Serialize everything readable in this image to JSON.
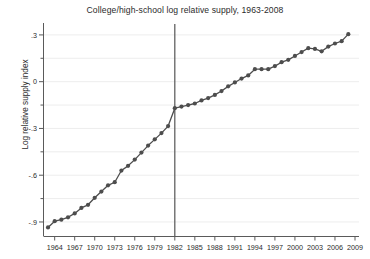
{
  "chart_data": {
    "type": "line",
    "title": "College/high-school log relative supply, 1963-2008",
    "xlabel": "",
    "ylabel": "Log relative supply index",
    "xlim": [
      1962.4,
      2009.6
    ],
    "ylim": [
      -0.99,
      0.37
    ],
    "xticks": [
      1964,
      1967,
      1970,
      1973,
      1976,
      1979,
      1982,
      1985,
      1988,
      1991,
      1994,
      1997,
      2000,
      2003,
      2006,
      2009
    ],
    "xtick_labels": [
      "1964",
      "1967",
      "1970",
      "1973",
      "1976",
      "1979",
      "1982",
      "1985",
      "1988",
      "1991",
      "1994",
      "1997",
      "2000",
      "2003",
      "2006",
      "2009"
    ],
    "yticks": [
      0.3,
      0.15,
      0,
      -0.15,
      -0.3,
      -0.45,
      -0.6,
      -0.75,
      -0.9
    ],
    "ytick_labels": [
      ".3",
      "",
      "0",
      "",
      "-.3",
      "",
      "-.6",
      "",
      "-.9"
    ],
    "ytick_major": [
      0.3,
      0,
      -0.3,
      -0.6,
      -0.9
    ],
    "grid": true,
    "legend": "none",
    "marker": "filled-circle",
    "line_color": "#4d4d4d",
    "marker_color": "#4d4d4d",
    "grid_color": "#ededed",
    "axis_color": "#5a5a5a",
    "vline": {
      "x": 1982,
      "color": "#555555",
      "label": ""
    },
    "x": [
      1963,
      1964,
      1965,
      1966,
      1967,
      1968,
      1969,
      1970,
      1971,
      1972,
      1973,
      1974,
      1975,
      1976,
      1977,
      1978,
      1979,
      1980,
      1981,
      1982,
      1983,
      1984,
      1985,
      1986,
      1987,
      1988,
      1989,
      1990,
      1991,
      1992,
      1993,
      1994,
      1995,
      1996,
      1997,
      1998,
      1999,
      2000,
      2001,
      2002,
      2003,
      2004,
      2005,
      2006,
      2007,
      2008
    ],
    "y": [
      -0.935,
      -0.895,
      -0.885,
      -0.87,
      -0.845,
      -0.81,
      -0.79,
      -0.745,
      -0.705,
      -0.665,
      -0.645,
      -0.57,
      -0.54,
      -0.5,
      -0.455,
      -0.41,
      -0.37,
      -0.33,
      -0.285,
      -0.17,
      -0.16,
      -0.15,
      -0.14,
      -0.12,
      -0.105,
      -0.085,
      -0.06,
      -0.03,
      -0.005,
      0.02,
      0.04,
      0.08,
      0.08,
      0.08,
      0.1,
      0.125,
      0.14,
      0.165,
      0.19,
      0.215,
      0.21,
      0.195,
      0.225,
      0.245,
      0.26,
      0.305
    ]
  }
}
